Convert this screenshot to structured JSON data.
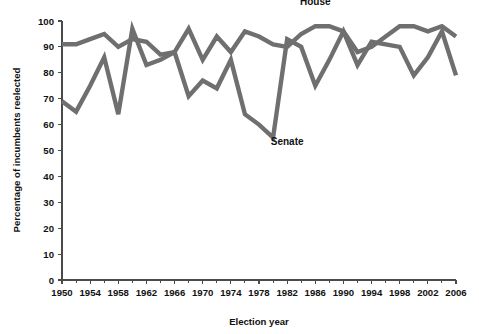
{
  "chart_data": {
    "type": "line",
    "title": "",
    "xlabel": "Election year",
    "ylabel": "Percentage of incumbents reelected",
    "xlim": [
      1950,
      2006
    ],
    "ylim": [
      0,
      100
    ],
    "grid": false,
    "legend_position": "inline-annotation",
    "x": [
      1950,
      1952,
      1954,
      1956,
      1958,
      1960,
      1962,
      1964,
      1966,
      1968,
      1970,
      1972,
      1974,
      1976,
      1978,
      1980,
      1982,
      1984,
      1986,
      1988,
      1990,
      1992,
      1994,
      1996,
      1998,
      2000,
      2002,
      2004,
      2006
    ],
    "x_tick_labels": [
      "1950",
      "1954",
      "1958",
      "1962",
      "1966",
      "1970",
      "1974",
      "1978",
      "1982",
      "1986",
      "1990",
      "1994",
      "1998",
      "2002",
      "2006"
    ],
    "x_tick_values": [
      1950,
      1954,
      1958,
      1962,
      1966,
      1970,
      1974,
      1978,
      1982,
      1986,
      1990,
      1994,
      1998,
      2002,
      2006
    ],
    "x_minor_tick_values": [
      1952,
      1956,
      1960,
      1964,
      1968,
      1972,
      1976,
      1980,
      1984,
      1988,
      1992,
      1996,
      2000,
      2004
    ],
    "y_tick_labels": [
      "0",
      "10",
      "20",
      "30",
      "40",
      "50",
      "60",
      "70",
      "80",
      "90",
      "100"
    ],
    "y_tick_values": [
      0,
      10,
      20,
      30,
      40,
      50,
      60,
      70,
      80,
      90,
      100
    ],
    "series": [
      {
        "name": "House",
        "label": "House",
        "color": "#6f6f6f",
        "label_x": 1986,
        "label_y": 106,
        "values": [
          91,
          91,
          93,
          95,
          90,
          93,
          92,
          87,
          88,
          97,
          85,
          94,
          88,
          96,
          94,
          91,
          90,
          95,
          98,
          98,
          96,
          88,
          90,
          94,
          98,
          98,
          96,
          98,
          94
        ]
      },
      {
        "name": "Senate",
        "label": "Senate",
        "color": "#6f6f6f",
        "label_x": 1982,
        "label_y": 52,
        "values": [
          69,
          65,
          75,
          86,
          64,
          97,
          83,
          85,
          88,
          71,
          77,
          74,
          85,
          64,
          60,
          55,
          93,
          90,
          75,
          85,
          96,
          83,
          92,
          91,
          90,
          79,
          86,
          96,
          79
        ]
      }
    ]
  },
  "axes": {
    "x_label": "Election year",
    "y_label": "Percentage of incumbents reelected"
  },
  "annotations": {
    "house_label": "House",
    "senate_label": "Senate"
  }
}
